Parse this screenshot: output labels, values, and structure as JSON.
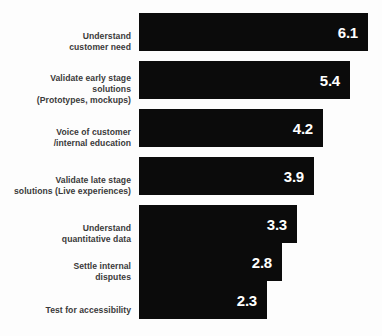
{
  "chart_data": {
    "type": "bar",
    "orientation": "horizontal",
    "title": "",
    "subtitle": "",
    "xlabel": "",
    "ylabel": "",
    "grid": false,
    "legend": null,
    "xlim": [
      0,
      6.1
    ],
    "categories": [
      "Understand\ncustomer need",
      "Validate early stage\nsolutions\n(Prototypes, mockups)",
      "Voice of customer\n/internal education",
      "Validate late stage\nsolutions (Live experiences)",
      "Understand\nquantitative data",
      "Settle internal\ndisputes",
      "Test for accessibility"
    ],
    "values": [
      6.1,
      5.4,
      4.2,
      3.9,
      3.3,
      2.8,
      2.3
    ],
    "value_labels": [
      "6.1",
      "5.4",
      "4.2",
      "3.9",
      "3.3",
      "2.8",
      "2.3"
    ],
    "bar_color": "#0b0b0b",
    "value_label_color": "#ffffff",
    "category_label_color": "#3a3a3a",
    "background_color": "#fdfdfd"
  },
  "layout": {
    "bars": [
      {
        "top": 13,
        "height": 38,
        "width": 229,
        "label_top": 18,
        "value_right": 10
      },
      {
        "top": 61,
        "height": 38,
        "width": 211,
        "label_top": 12,
        "value_right": 10
      },
      {
        "top": 109,
        "height": 38,
        "width": 184,
        "label_top": 18,
        "value_right": 10
      },
      {
        "top": 157,
        "height": 38,
        "width": 175,
        "label_top": 18,
        "value_right": 10
      },
      {
        "top": 205,
        "height": 38,
        "width": 158,
        "label_top": 18,
        "value_right": 10
      },
      {
        "top": 243,
        "height": 38,
        "width": 143,
        "label_top": 18,
        "value_right": 10
      },
      {
        "top": 281,
        "height": 38,
        "width": 128,
        "label_top": 24,
        "value_right": 10
      }
    ]
  }
}
